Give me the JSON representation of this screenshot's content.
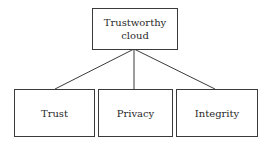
{
  "diagram": {
    "type": "tree",
    "root": {
      "label_line1": "Trustworthy",
      "label_line2": "cloud"
    },
    "children": [
      {
        "label": "Trust"
      },
      {
        "label": "Privacy"
      },
      {
        "label": "Integrity"
      }
    ],
    "colors": {
      "stroke": "#3a3a3a",
      "text": "#2a2a2a",
      "background": "#ffffff"
    }
  }
}
